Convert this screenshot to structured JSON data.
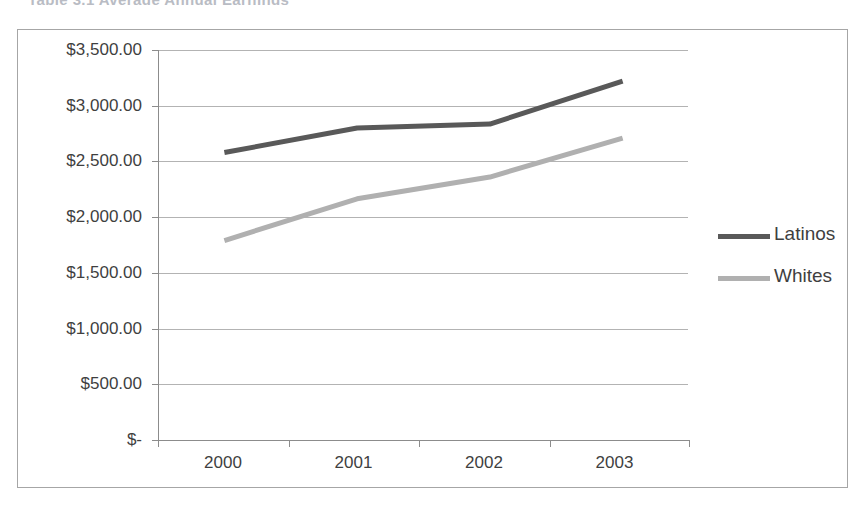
{
  "page": {
    "cut_off_text": "Table 3.1  Average Annual Earnings",
    "background_color": "#ffffff",
    "frame_border_color": "#a6a6a6"
  },
  "chart_data": {
    "type": "line",
    "title": "",
    "xlabel": "",
    "ylabel": "",
    "categories": [
      "2000",
      "2001",
      "2002",
      "2003"
    ],
    "series": [
      {
        "name": "Latinos",
        "color": "#595959",
        "values": [
          2580,
          2800,
          2835,
          3220
        ]
      },
      {
        "name": "Whites",
        "color": "#b0b0b0",
        "values": [
          1790,
          2165,
          2360,
          2710
        ]
      }
    ],
    "ylim": [
      0,
      3500
    ],
    "ytick_values": [
      3500,
      3000,
      2500,
      2000,
      1500,
      1000,
      500,
      0
    ],
    "ytick_labels": [
      "$3,500.00",
      "$3,000.00",
      "$2,500.00",
      "$2,000.00",
      "$1,500.00",
      "$1,000.00",
      "$500.00",
      "$-"
    ],
    "grid": true,
    "grid_color": "#b3b3b3",
    "axis_color": "#8c8c8c",
    "legend_position": "right",
    "legend": [
      "Latinos",
      "Whites"
    ]
  }
}
